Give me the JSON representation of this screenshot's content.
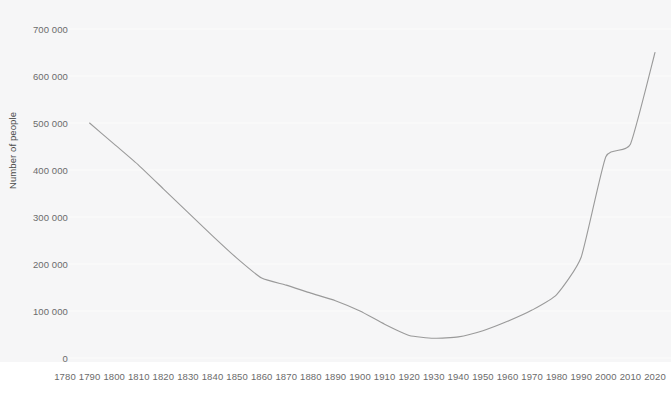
{
  "chart_data": {
    "type": "line",
    "title": "",
    "xlabel": "",
    "ylabel": "Number of people",
    "xlim": [
      1780,
      2020
    ],
    "ylim": [
      0,
      700000
    ],
    "grid": true,
    "legend": false,
    "legend_position": "none",
    "line_color": "#9a9a9a",
    "background_color": "#f6f6f7",
    "gridline_color": "#fcfcfc",
    "tick_text_color": "#6b6b6b",
    "x_tick_labels": [
      "1780",
      "1790",
      "1800",
      "1810",
      "1820",
      "1830",
      "1840",
      "1850",
      "1860",
      "1870",
      "1880",
      "1890",
      "1900",
      "1910",
      "1920",
      "1930",
      "1940",
      "1950",
      "1960",
      "1970",
      "1980",
      "1990",
      "2000",
      "2010",
      "2020"
    ],
    "y_tick_labels": [
      "0",
      "100 000",
      "200 000",
      "300 000",
      "400 000",
      "500 000",
      "600 000",
      "700 000"
    ],
    "y_tick_values": [
      0,
      100000,
      200000,
      300000,
      400000,
      500000,
      600000,
      700000
    ],
    "x": [
      1790,
      1800,
      1810,
      1820,
      1830,
      1840,
      1850,
      1860,
      1870,
      1880,
      1890,
      1900,
      1910,
      1920,
      1930,
      1940,
      1950,
      1960,
      1970,
      1980,
      1990,
      2000,
      2010,
      2020
    ],
    "series": [
      {
        "name": "Number of people",
        "values": [
          500000,
          455000,
          410000,
          360000,
          310000,
          260000,
          212000,
          170000,
          155000,
          138000,
          122000,
          100000,
          72000,
          48000,
          42000,
          45000,
          58000,
          78000,
          102000,
          135000,
          215000,
          428000,
          455000,
          650000
        ]
      }
    ]
  }
}
